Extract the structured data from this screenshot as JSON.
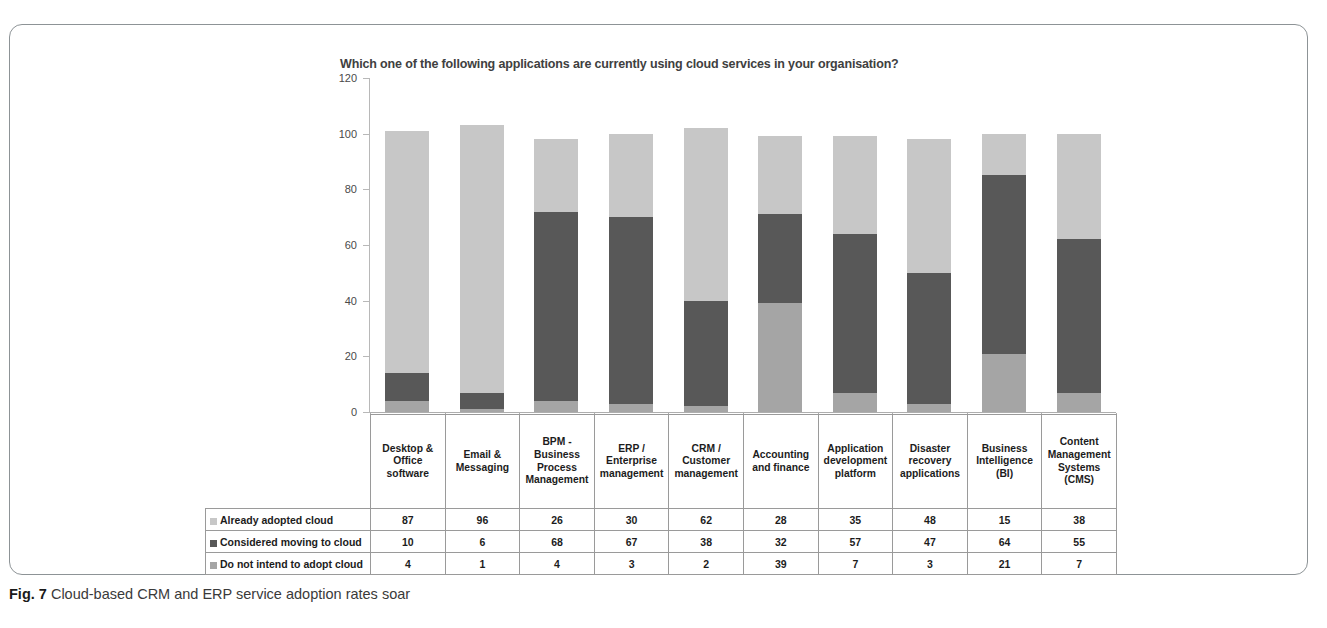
{
  "figure": {
    "caption_prefix": "Fig. 7",
    "caption_text": "Cloud-based CRM and ERP service adoption rates soar"
  },
  "chart_data": {
    "type": "bar",
    "subtype": "stacked-column",
    "title": "Which one of the following applications are currently using cloud services in your organisation?",
    "xlabel": "",
    "ylabel": "",
    "ylim": [
      0,
      120
    ],
    "yticks": [
      0,
      20,
      40,
      60,
      80,
      100,
      120
    ],
    "grid": false,
    "legend_position": "table-left",
    "categories": [
      "Desktop & Office software",
      "Email & Messaging",
      "BPM - Business Process Management",
      "ERP / Enterprise management",
      "CRM / Customer management",
      "Accounting and finance",
      "Application development platform",
      "Disaster recovery applications",
      "Business Intelligence (BI)",
      "Content Management Systems (CMS)"
    ],
    "series": [
      {
        "name": "Already adopted cloud",
        "color": "#c7c7c7",
        "values": [
          87,
          96,
          26,
          30,
          62,
          28,
          35,
          48,
          15,
          38
        ]
      },
      {
        "name": "Considered moving to cloud",
        "color": "#585858",
        "values": [
          10,
          6,
          68,
          67,
          38,
          32,
          57,
          47,
          64,
          55
        ]
      },
      {
        "name": "Do not intend to adopt cloud",
        "color": "#a5a5a5",
        "values": [
          4,
          1,
          4,
          3,
          2,
          39,
          7,
          3,
          21,
          7
        ]
      }
    ],
    "stack_order_bottom_to_top": [
      "Do not intend to adopt cloud",
      "Considered moving to cloud",
      "Already adopted cloud"
    ]
  }
}
